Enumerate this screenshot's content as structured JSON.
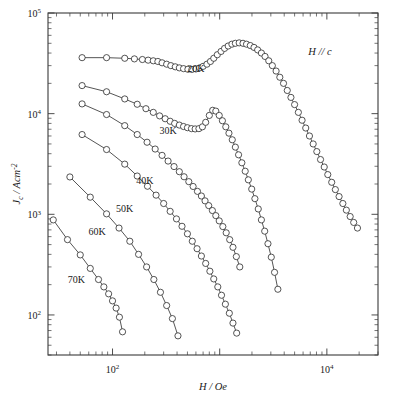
{
  "figure": {
    "annotation": "H // c",
    "annotation_parts": {
      "h": "H",
      "slashes": " // ",
      "c": "c"
    }
  },
  "axes": {
    "x": {
      "label_num": "H",
      "label_den": " / Oe",
      "ticks": [
        {
          "value": 100,
          "mantissa": "10",
          "exponent": "2"
        },
        {
          "value": 10000,
          "mantissa": "10",
          "exponent": "4"
        }
      ],
      "range": [
        25,
        30000
      ]
    },
    "y": {
      "label_num": "J",
      "label_sub": "c",
      "label_den": " / Acm",
      "label_sup": "-2",
      "ticks": [
        {
          "value": 100,
          "mantissa": "10",
          "exponent": "2"
        },
        {
          "value": 1000,
          "mantissa": "10",
          "exponent": "3"
        },
        {
          "value": 10000,
          "mantissa": "10",
          "exponent": "4"
        },
        {
          "value": 100000,
          "mantissa": "10",
          "exponent": "5"
        }
      ],
      "range": [
        40,
        100000
      ]
    }
  },
  "chart_data": {
    "type": "scatter",
    "title": "",
    "xlabel": "H / Oe",
    "ylabel": "Jc / Acm^-2",
    "xscale": "log",
    "yscale": "log",
    "xlim": [
      25,
      30000
    ],
    "ylim": [
      40,
      100000
    ],
    "grid": false,
    "legend": "inline-labels",
    "annotations": [
      {
        "text": "H // c",
        "x": 6500,
        "y": 58000
      }
    ],
    "series": [
      {
        "name": "20K",
        "label": "20K",
        "label_x": 600,
        "label_y": 26000,
        "x": [
          52,
          88,
          130,
          160,
          190,
          215,
          240,
          265,
          290,
          320,
          350,
          385,
          420,
          460,
          505,
          550,
          600,
          650,
          700,
          760,
          820,
          880,
          950,
          1030,
          1110,
          1200,
          1300,
          1400,
          1520,
          1650,
          1780,
          1930,
          2090,
          2260,
          2450,
          2650,
          2870,
          3100,
          3360,
          3640,
          3940,
          4270,
          4620,
          5000,
          5420,
          5870,
          6350,
          6880,
          7450,
          8060,
          8730,
          9450,
          10200,
          11100,
          12000,
          13000,
          14100,
          15200,
          16500,
          17800,
          19300
        ],
        "y": [
          36000,
          36000,
          35500,
          35000,
          34500,
          34000,
          33500,
          33000,
          32000,
          31000,
          30000,
          29200,
          28500,
          28000,
          27600,
          27500,
          27800,
          28500,
          29500,
          31000,
          33000,
          35500,
          38500,
          41500,
          44500,
          47000,
          49000,
          50000,
          50500,
          50000,
          49000,
          47500,
          45500,
          43000,
          40000,
          37000,
          33500,
          30000,
          26500,
          23000,
          20000,
          17000,
          14500,
          12300,
          10300,
          8600,
          7200,
          6000,
          5000,
          4200,
          3500,
          2950,
          2480,
          2080,
          1760,
          1500,
          1280,
          1100,
          950,
          830,
          730
        ]
      },
      {
        "name": "30K",
        "label": "30K",
        "label_x": 330,
        "label_y": 6300,
        "x": [
          52,
          88,
          130,
          170,
          205,
          240,
          275,
          310,
          345,
          380,
          420,
          460,
          500,
          545,
          590,
          640,
          690,
          740,
          800,
          860,
          920,
          990,
          1060,
          1140,
          1220,
          1310,
          1400,
          1500,
          1610,
          1730,
          1850,
          1990,
          2130,
          2290,
          2450,
          2630,
          2820,
          3030,
          3250,
          3490
        ],
        "y": [
          19000,
          16500,
          14000,
          12400,
          11200,
          10300,
          9500,
          8900,
          8400,
          8000,
          7700,
          7450,
          7250,
          7100,
          7050,
          7100,
          7400,
          8200,
          9600,
          10800,
          10600,
          9600,
          8500,
          7400,
          6400,
          5500,
          4650,
          3900,
          3250,
          2680,
          2200,
          1780,
          1430,
          1130,
          880,
          680,
          510,
          375,
          265,
          180
        ]
      },
      {
        "name": "40K",
        "label": "40K",
        "label_x": 200,
        "label_y": 2000,
        "x": [
          52,
          88,
          130,
          170,
          210,
          250,
          290,
          330,
          375,
          420,
          465,
          515,
          565,
          620,
          675,
          730,
          790,
          855,
          920,
          990,
          1070,
          1150,
          1240,
          1330,
          1430,
          1540
        ],
        "y": [
          12500,
          9800,
          7600,
          6200,
          5200,
          4450,
          3850,
          3380,
          2980,
          2650,
          2360,
          2110,
          1890,
          1690,
          1520,
          1360,
          1220,
          1090,
          970,
          860,
          755,
          655,
          560,
          470,
          380,
          300
        ]
      },
      {
        "name": "50K",
        "label": "50K",
        "label_x": 130,
        "label_y": 1050,
        "x": [
          52,
          88,
          130,
          170,
          212,
          255,
          300,
          345,
          395,
          445,
          500,
          555,
          615,
          675,
          740,
          810,
          880,
          960,
          1040,
          1130,
          1230,
          1330,
          1440
        ],
        "y": [
          6200,
          4400,
          3150,
          2400,
          1900,
          1550,
          1280,
          1070,
          900,
          760,
          640,
          540,
          455,
          385,
          325,
          272,
          228,
          190,
          157,
          128,
          104,
          83,
          66
        ]
      },
      {
        "name": "60K",
        "label": "60K",
        "label_x": 72,
        "label_y": 620,
        "x": [
          40,
          62,
          88,
          115,
          145,
          175,
          208,
          243,
          280,
          320,
          362,
          408
        ],
        "y": [
          2350,
          1480,
          1010,
          730,
          540,
          400,
          300,
          225,
          168,
          124,
          92,
          62
        ]
      },
      {
        "name": "70K",
        "label": "70K",
        "label_x": 46,
        "label_y": 210,
        "x": [
          28,
          38,
          50,
          62,
          74,
          83,
          92,
          100,
          108,
          116,
          124
        ],
        "y": [
          880,
          560,
          395,
          290,
          225,
          190,
          162,
          138,
          117,
          95,
          68
        ]
      }
    ]
  }
}
